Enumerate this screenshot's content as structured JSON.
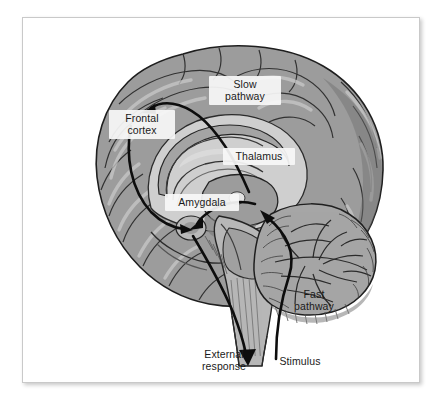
{
  "figure": {
    "type": "anatomical-diagram",
    "background_color": "#ffffff",
    "panel_border_color": "#c9c9c9",
    "ink_color": "#111111",
    "cortex_color": "#9a9a9a",
    "cortex_light_color": "#c4c4c4",
    "cortex_dark_color": "#7a7a7a",
    "inner_structure_color": "#bdbdbd",
    "brainstem_color": "#b5b5b5",
    "cerebellum_color": "#a3a3a3"
  },
  "labels": {
    "slow_pathway": "Slow\npathway",
    "frontal_cortex": "Frontal\ncortex",
    "thalamus": "Thalamus",
    "amygdala": "Amygdala",
    "fast_pathway": "Fast\npathway",
    "external_response": "External\nresponse",
    "stimulus": "Stimulus"
  },
  "pathways": [
    {
      "name": "fast-pathway",
      "description": "stimulus ascends brainstem to thalamus then direct to amygdala",
      "arrow_color": "#111111"
    },
    {
      "name": "slow-pathway",
      "description": "thalamus to frontal cortex then down to amygdala",
      "arrow_color": "#111111"
    },
    {
      "name": "external-response",
      "description": "amygdala descends through brainstem to external response",
      "arrow_color": "#111111"
    }
  ],
  "structures": [
    "cerebral cortex",
    "corpus callosum",
    "thalamus",
    "amygdala",
    "brainstem",
    "cerebellum",
    "spinal cord"
  ]
}
